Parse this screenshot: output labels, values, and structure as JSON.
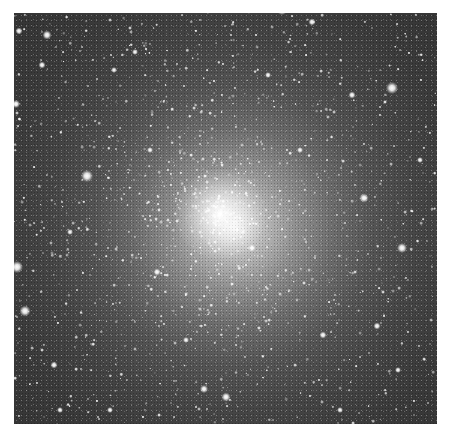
{
  "image": {
    "subject": "globular star cluster",
    "colors": {
      "border": "#ffffff",
      "sky": "#333333",
      "core": "#f4f4f4"
    },
    "frame": {
      "left": 14,
      "top": 13,
      "width": 423,
      "height": 411
    },
    "core": {
      "x": 220,
      "y": 214,
      "size": 90
    },
    "bright_stars": [
      {
        "x": 47,
        "y": 35,
        "s": 9
      },
      {
        "x": 19,
        "y": 31,
        "s": 7
      },
      {
        "x": 282,
        "y": 10,
        "s": 10
      },
      {
        "x": 312,
        "y": 22,
        "s": 7
      },
      {
        "x": 16,
        "y": 104,
        "s": 8
      },
      {
        "x": 42,
        "y": 65,
        "s": 7
      },
      {
        "x": 87,
        "y": 176,
        "s": 12
      },
      {
        "x": 392,
        "y": 88,
        "s": 12
      },
      {
        "x": 352,
        "y": 95,
        "s": 7
      },
      {
        "x": 364,
        "y": 198,
        "s": 9
      },
      {
        "x": 402,
        "y": 248,
        "s": 10
      },
      {
        "x": 17,
        "y": 267,
        "s": 12
      },
      {
        "x": 25,
        "y": 311,
        "s": 11
      },
      {
        "x": 54,
        "y": 365,
        "s": 7
      },
      {
        "x": 226,
        "y": 397,
        "s": 9
      },
      {
        "x": 204,
        "y": 389,
        "s": 8
      },
      {
        "x": 252,
        "y": 248,
        "s": 7
      },
      {
        "x": 114,
        "y": 70,
        "s": 6
      },
      {
        "x": 135,
        "y": 52,
        "s": 6
      },
      {
        "x": 323,
        "y": 335,
        "s": 7
      },
      {
        "x": 377,
        "y": 326,
        "s": 7
      },
      {
        "x": 157,
        "y": 272,
        "s": 7
      },
      {
        "x": 398,
        "y": 370,
        "s": 6
      },
      {
        "x": 300,
        "y": 150,
        "s": 6
      },
      {
        "x": 150,
        "y": 150,
        "s": 6
      },
      {
        "x": 186,
        "y": 340,
        "s": 6
      },
      {
        "x": 268,
        "y": 75,
        "s": 6
      },
      {
        "x": 70,
        "y": 232,
        "s": 6
      },
      {
        "x": 420,
        "y": 160,
        "s": 6
      },
      {
        "x": 340,
        "y": 410,
        "s": 6
      },
      {
        "x": 110,
        "y": 410,
        "s": 6
      },
      {
        "x": 60,
        "y": 410,
        "s": 6
      }
    ],
    "field_star_seed": 1337,
    "field_star_count": 1400
  }
}
